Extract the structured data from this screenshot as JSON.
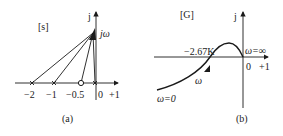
{
  "panel_a": {
    "plane_label": "[s]",
    "imag_axis_label": "j",
    "point_label": "jω",
    "ticks": [
      "−2",
      "−1",
      "−0.5",
      "0",
      "+1"
    ],
    "caption": "(a)",
    "poles": [
      -2,
      -1,
      0
    ],
    "zeros": [
      -0.5
    ]
  },
  "panel_b": {
    "plane_label": "[G]",
    "imag_axis_label": "j",
    "crossing_label": "−2.67K",
    "omega_inf_label": "ω=∞",
    "omega_label": "ω",
    "omega_zero_label": "ω=0",
    "ticks": [
      "0",
      "+1"
    ],
    "caption": "(b)"
  },
  "colors": {
    "stroke": "#1a1a1a"
  }
}
